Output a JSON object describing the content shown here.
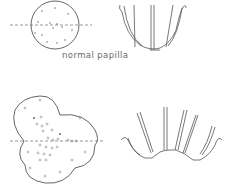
{
  "figure": {
    "caption": "normal papilla",
    "panels": [
      {
        "name": "normal-papilla-top-view",
        "shape": "circle"
      },
      {
        "name": "normal-papilla-side-view",
        "shape": "cup"
      },
      {
        "name": "abnormal-papilla-top-view",
        "shape": "multilobed"
      },
      {
        "name": "abnormal-papilla-side-view",
        "shape": "spread-cup"
      }
    ],
    "colors": {
      "line": "#555555",
      "background": "#ffffff"
    }
  }
}
